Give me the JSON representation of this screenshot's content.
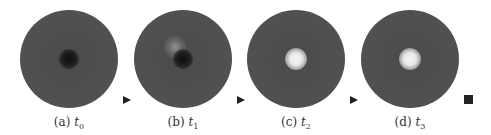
{
  "figure": {
    "panels": [
      {
        "label": "(a)",
        "time": "t",
        "sub": "0",
        "spot": "dark"
      },
      {
        "label": "(b)",
        "time": "t",
        "sub": "1",
        "spot": "dark-with-bright-haze"
      },
      {
        "label": "(c)",
        "time": "t",
        "sub": "2",
        "spot": "bright"
      },
      {
        "label": "(d)",
        "time": "t",
        "sub": "3",
        "spot": "bright"
      }
    ],
    "connectors": [
      "play-triangle",
      "play-triangle",
      "play-triangle"
    ],
    "end_marker": "stop-square",
    "colors": {
      "disc": "#505050",
      "marker": "#222222",
      "caption": "#333333"
    }
  }
}
